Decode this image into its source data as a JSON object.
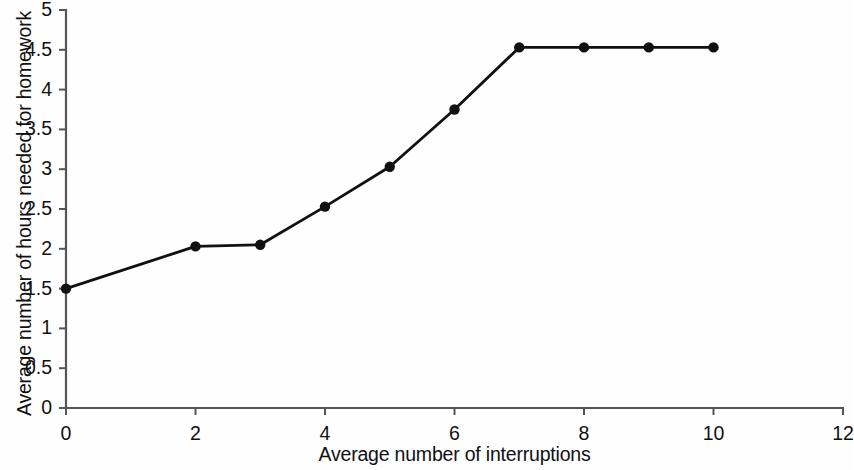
{
  "chart_data": {
    "type": "line",
    "title": "",
    "subtitle": "",
    "xlabel": "Average number of interruptions",
    "ylabel": "Average number of hours needed for homework",
    "xlim": [
      0,
      12
    ],
    "ylim": [
      0,
      5
    ],
    "xticks": [
      0,
      2,
      4,
      6,
      8,
      10,
      12
    ],
    "xtick_labels": [
      "0",
      "2",
      "4",
      "6",
      "8",
      "10",
      "12"
    ],
    "yticks": [
      0,
      0.5,
      1,
      1.5,
      2,
      2.5,
      3,
      3.5,
      4,
      4.5,
      5
    ],
    "ytick_labels": [
      "0",
      "0.5",
      "1",
      "1.5",
      "2",
      "2.5",
      "3",
      "3.5",
      "4",
      "4.5",
      "5"
    ],
    "grid": false,
    "legend": null,
    "legend_position": "none",
    "series": [
      {
        "name": "Hours needed for homework",
        "marker": "circle",
        "color": "#111111",
        "x": [
          0,
          2,
          3,
          4,
          5,
          6,
          7,
          8,
          9,
          10
        ],
        "values": [
          1.5,
          2.03,
          2.05,
          2.53,
          3.03,
          3.75,
          4.53,
          4.53,
          4.53,
          4.53
        ],
        "points": [
          {
            "x": 0,
            "y": 1.5
          },
          {
            "x": 2,
            "y": 2.03
          },
          {
            "x": 3,
            "y": 2.05
          },
          {
            "x": 4,
            "y": 2.53
          },
          {
            "x": 5,
            "y": 3.03
          },
          {
            "x": 6,
            "y": 3.75
          },
          {
            "x": 7,
            "y": 4.53
          },
          {
            "x": 8,
            "y": 4.53
          },
          {
            "x": 9,
            "y": 4.53
          },
          {
            "x": 10,
            "y": 4.53
          }
        ]
      }
    ],
    "annotations": [],
    "colors": {
      "line": "#111111",
      "marker": "#111111",
      "axis": "#555555",
      "background": "#fefefe",
      "text": "#111111"
    }
  },
  "axes": {
    "x_title": "Average number of interruptions",
    "y_title": "Average number of hours needed for homework"
  }
}
